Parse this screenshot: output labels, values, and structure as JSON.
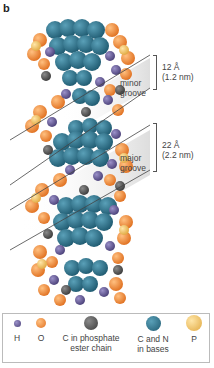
{
  "panel_label": "b",
  "annotations": {
    "minor": {
      "width": "12 Å",
      "width_nm": "(1.2 nm)",
      "label_line1": "minor",
      "label_line2": "groove"
    },
    "major": {
      "width": "22 Å",
      "width_nm": "(2.2 nm)",
      "label_line1": "major",
      "label_line2": "groove"
    }
  },
  "legend": {
    "items": [
      {
        "label": "H",
        "color": "#6a5f9a",
        "icon": "hydrogen-atom-ball"
      },
      {
        "label": "O",
        "color": "#f08a3a",
        "icon": "oxygen-atom-ball"
      },
      {
        "label": "C in phosphate\nester chain",
        "line1": "C in phosphate",
        "line2": "ester chain",
        "color": "#5a5a5a",
        "icon": "phosphate-carbon-atom-ball"
      },
      {
        "label": "C and N\nin  bases",
        "line1": "C and N",
        "line2": "in  bases",
        "color": "#2e6e86",
        "icon": "base-carbon-nitrogen-atom-ball"
      },
      {
        "label": "P",
        "color": "#f2c860",
        "icon": "phosphorus-atom-ball"
      }
    ]
  },
  "colors": {
    "hydrogen": "#6a5f9a",
    "oxygen": "#f08a3a",
    "carbon_phosphate": "#5a5a5a",
    "carbon_nitrogen_bases": "#2e6e86",
    "phosphorus": "#f2c860",
    "groove_shade": "#d8d8d8"
  }
}
